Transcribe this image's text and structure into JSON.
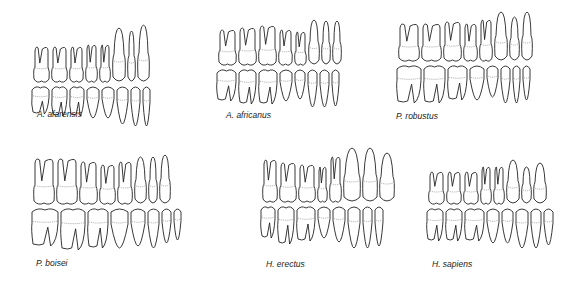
{
  "figure": {
    "panels": [
      {
        "id": "afarensis",
        "label": "A. afarensis",
        "row": 1,
        "col": 1
      },
      {
        "id": "africanus",
        "label": "A. africanus",
        "row": 1,
        "col": 2
      },
      {
        "id": "robustus",
        "label": "P. robustus",
        "row": 1,
        "col": 3
      },
      {
        "id": "boisei",
        "label": "P. boisei",
        "row": 2,
        "col": 1
      },
      {
        "id": "erectus",
        "label": "H. erectus",
        "row": 2,
        "col": 2
      },
      {
        "id": "sapiens",
        "label": "H. sapiens",
        "row": 2,
        "col": 3
      }
    ],
    "teeth_per_row": 8,
    "rows_per_panel": [
      "upper",
      "lower"
    ]
  }
}
